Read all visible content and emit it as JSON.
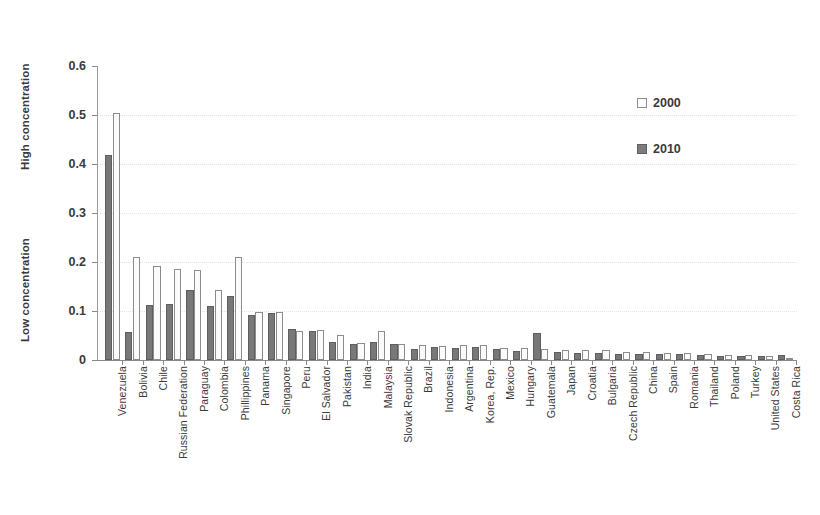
{
  "chart_data": {
    "type": "bar",
    "title": "",
    "xlabel": "",
    "ylabel": "",
    "ylim": [
      0,
      0.6
    ],
    "ytick_labels": [
      "0.6",
      "0.5",
      "0.4",
      "0.3",
      "0.2",
      "0.1",
      "0"
    ],
    "ytick_values": [
      0.6,
      0.5,
      0.4,
      0.3,
      0.2,
      0.1,
      0
    ],
    "grid": true,
    "legend_position": "right",
    "axis_group_labels": {
      "high": "High concentration",
      "low": "Low concentration"
    },
    "categories": [
      "Venezuela",
      "Bolivia",
      "Chile",
      "Russian Federation",
      "Paraguay",
      "Colombia",
      "Phillippines",
      "Panama",
      "Singapore",
      "Peru",
      "El Salvador",
      "Pakistan",
      "India",
      "Malaysia",
      "Slovak Republic",
      "Brazil",
      "Indonesia",
      "Argentina",
      "Korea, Rep.",
      "Mexico",
      "Hungary",
      "Guatemala",
      "Japan",
      "Croatia",
      "Bulgaria",
      "Czech Republic",
      "China",
      "Spain",
      "Romania",
      "Thailand",
      "Poland",
      "Turkey",
      "United States",
      "Costa Rica"
    ],
    "series": [
      {
        "name": "2000",
        "color": "#fbfbfb",
        "values": [
          0.505,
          0.21,
          0.192,
          0.186,
          0.184,
          0.142,
          0.21,
          0.098,
          0.098,
          0.06,
          0.062,
          0.052,
          0.035,
          0.06,
          0.032,
          0.03,
          0.029,
          0.031,
          0.03,
          0.025,
          0.024,
          0.022,
          0.021,
          0.02,
          0.02,
          0.016,
          0.016,
          0.015,
          0.014,
          0.012,
          0.01,
          0.01,
          0.009,
          0.002
        ]
      },
      {
        "name": "2010",
        "color": "#787878",
        "values": [
          0.419,
          0.058,
          0.113,
          0.114,
          0.142,
          0.111,
          0.13,
          0.092,
          0.095,
          0.064,
          0.06,
          0.036,
          0.033,
          0.037,
          0.033,
          0.023,
          0.026,
          0.024,
          0.026,
          0.022,
          0.018,
          0.056,
          0.016,
          0.015,
          0.014,
          0.013,
          0.013,
          0.012,
          0.012,
          0.011,
          0.009,
          0.008,
          0.008,
          0.011
        ]
      }
    ]
  },
  "legend": {
    "items": [
      {
        "label": "2000",
        "swatch": "open-square-swatch"
      },
      {
        "label": "2010",
        "swatch": "filled-square-swatch"
      }
    ]
  }
}
